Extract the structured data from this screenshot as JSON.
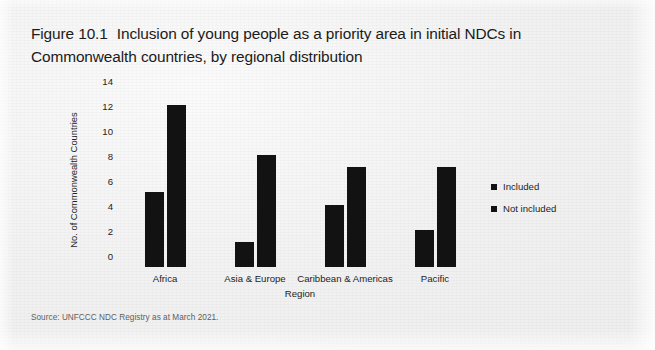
{
  "figure": {
    "number": "Figure 10.1",
    "title": "Inclusion of young people as a priority area in initial NDCs in Commonwealth countries, by regional distribution",
    "source_note": "Source: UNFCCC NDC Registry as at March 2021."
  },
  "chart_data": {
    "type": "bar",
    "xlabel": "Region",
    "ylabel": "No. of Commonwealth Countries",
    "categories": [
      "Africa",
      "Asia & Europe",
      "Caribbean & Americas",
      "Pacific"
    ],
    "series": [
      {
        "name": "Included",
        "values": [
          6,
          2,
          5,
          3
        ],
        "color": "#121212"
      },
      {
        "name": "Not included",
        "values": [
          13,
          9,
          8,
          8
        ],
        "color": "#121212"
      }
    ],
    "ylim": [
      0,
      14
    ],
    "yticks": [
      0,
      2,
      4,
      6,
      8,
      10,
      12,
      14
    ],
    "ytick_labels": [
      "0",
      "2",
      "4",
      "6",
      "8",
      "10",
      "12",
      "14"
    ],
    "grid": false,
    "legend_position": "right",
    "legend_entries": [
      "Included",
      "Not included"
    ]
  }
}
